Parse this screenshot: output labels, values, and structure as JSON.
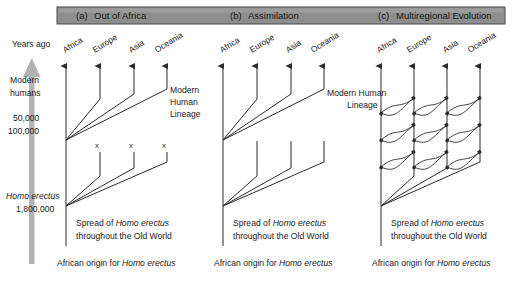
{
  "figure": {
    "panels": [
      {
        "key": "a",
        "tag": "(a)",
        "title": "Out of Africa"
      },
      {
        "key": "b",
        "tag": "(b)",
        "title": "Assimilation"
      },
      {
        "key": "c",
        "tag": "(c)",
        "title": "Multiregional Evolution"
      }
    ]
  },
  "axis": {
    "title": "Years ago",
    "modern_line1": "Modern",
    "modern_line2": "humans",
    "tick_50k": "50,000",
    "tick_100k": "100,000",
    "erectus_label": "Homo erectus",
    "erectus_date": "1,800,000",
    "arrow_color": "#b3b3b3"
  },
  "regions": [
    "Africa",
    "Europe",
    "Asia",
    "Oceania"
  ],
  "panel_a": {
    "lineage_line1": "Modern",
    "lineage_line2": "Human",
    "lineage_line3": "Lineage",
    "spread_line1": "Spread of Homo erectus",
    "spread_line1_roman": "Spread of ",
    "spread_line1_italic": "Homo erectus",
    "spread_line2": "throughout the Old World",
    "origin_roman": "African origin for ",
    "origin_italic": "Homo erectus",
    "extinction_marks": [
      "x",
      "x",
      "x"
    ]
  },
  "panel_b": {
    "lineage_line1": "Modern Human",
    "lineage_line2": "Lineage",
    "spread_line1_roman": "Spread of ",
    "spread_line1_italic": "Homo erectus",
    "spread_line2": "throughout the Old World",
    "origin_roman": "African origin for ",
    "origin_italic": "Homo erectus"
  },
  "panel_c": {
    "spread_line1_roman": "Spread of ",
    "spread_line1_italic": "Homo erectus",
    "spread_line2": "throughout the Old World",
    "origin_roman": "African origin for ",
    "origin_italic": "Homo erectus"
  },
  "colors": {
    "header_fill": "#8e8e8e",
    "header_stroke": "#4a4a4a",
    "line": "#2b2b2b",
    "text": "#1a1a1a"
  }
}
